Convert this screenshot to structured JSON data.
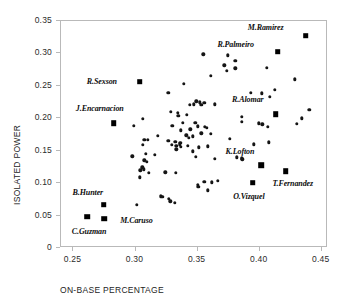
{
  "chart_data": {
    "type": "scatter",
    "title": "",
    "xlabel": "ON-BASE PERCENTAGE",
    "ylabel": "ISOLATED POWER",
    "xlim": [
      0.24,
      0.455
    ],
    "ylim": [
      0.0,
      0.35
    ],
    "xticks": [
      0.25,
      0.3,
      0.35,
      0.4,
      0.45
    ],
    "xticklabels": [
      "0.25",
      "0.30",
      "0.35",
      "0.40",
      "0.45"
    ],
    "yticks": [
      0.0,
      0.05,
      0.1,
      0.15,
      0.2,
      0.25,
      0.3,
      0.35
    ],
    "yticklabels": [
      "0",
      "0.05",
      "0.10",
      "0.15",
      "0.20",
      "0.25",
      "0.30",
      "0.35"
    ],
    "grid": false,
    "legend": null,
    "marker_unlabeled": "circle",
    "marker_labeled": "square",
    "points": [
      {
        "x": 0.3545,
        "y": 0.2985
      },
      {
        "x": 0.3745,
        "y": 0.297
      },
      {
        "x": 0.3805,
        "y": 0.2885
      },
      {
        "x": 0.3715,
        "y": 0.2815
      },
      {
        "x": 0.3805,
        "y": 0.277
      },
      {
        "x": 0.4055,
        "y": 0.278
      },
      {
        "x": 0.3735,
        "y": 0.273
      },
      {
        "x": 0.3605,
        "y": 0.2655
      },
      {
        "x": 0.4285,
        "y": 0.26
      },
      {
        "x": 0.339,
        "y": 0.253
      },
      {
        "x": 0.412,
        "y": 0.244
      },
      {
        "x": 0.393,
        "y": 0.2395
      },
      {
        "x": 0.4015,
        "y": 0.2385
      },
      {
        "x": 0.3265,
        "y": 0.239
      },
      {
        "x": 0.408,
        "y": 0.233
      },
      {
        "x": 0.349,
        "y": 0.226
      },
      {
        "x": 0.352,
        "y": 0.2245
      },
      {
        "x": 0.3555,
        "y": 0.224
      },
      {
        "x": 0.347,
        "y": 0.2215
      },
      {
        "x": 0.353,
        "y": 0.221
      },
      {
        "x": 0.3435,
        "y": 0.2205
      },
      {
        "x": 0.364,
        "y": 0.2215
      },
      {
        "x": 0.44,
        "y": 0.2135
      },
      {
        "x": 0.3285,
        "y": 0.21
      },
      {
        "x": 0.334,
        "y": 0.208
      },
      {
        "x": 0.3415,
        "y": 0.2055
      },
      {
        "x": 0.3345,
        "y": 0.2035
      },
      {
        "x": 0.3855,
        "y": 0.2025
      },
      {
        "x": 0.434,
        "y": 0.2
      },
      {
        "x": 0.306,
        "y": 0.1995
      },
      {
        "x": 0.338,
        "y": 0.1935
      },
      {
        "x": 0.348,
        "y": 0.193
      },
      {
        "x": 0.3855,
        "y": 0.1945
      },
      {
        "x": 0.43,
        "y": 0.1915
      },
      {
        "x": 0.3995,
        "y": 0.192
      },
      {
        "x": 0.402,
        "y": 0.1905
      },
      {
        "x": 0.3295,
        "y": 0.188
      },
      {
        "x": 0.2985,
        "y": 0.1885
      },
      {
        "x": 0.35,
        "y": 0.1875
      },
      {
        "x": 0.356,
        "y": 0.187
      },
      {
        "x": 0.3575,
        "y": 0.185
      },
      {
        "x": 0.4065,
        "y": 0.187
      },
      {
        "x": 0.344,
        "y": 0.183
      },
      {
        "x": 0.3365,
        "y": 0.1815
      },
      {
        "x": 0.353,
        "y": 0.177
      },
      {
        "x": 0.3605,
        "y": 0.1765
      },
      {
        "x": 0.318,
        "y": 0.173
      },
      {
        "x": 0.341,
        "y": 0.174
      },
      {
        "x": 0.346,
        "y": 0.172
      },
      {
        "x": 0.343,
        "y": 0.17
      },
      {
        "x": 0.376,
        "y": 0.1685
      },
      {
        "x": 0.307,
        "y": 0.1665
      },
      {
        "x": 0.31,
        "y": 0.167
      },
      {
        "x": 0.3265,
        "y": 0.165
      },
      {
        "x": 0.332,
        "y": 0.164
      },
      {
        "x": 0.336,
        "y": 0.1625
      },
      {
        "x": 0.3355,
        "y": 0.16
      },
      {
        "x": 0.329,
        "y": 0.159
      },
      {
        "x": 0.333,
        "y": 0.1575
      },
      {
        "x": 0.3365,
        "y": 0.156
      },
      {
        "x": 0.342,
        "y": 0.1575
      },
      {
        "x": 0.306,
        "y": 0.1595
      },
      {
        "x": 0.4075,
        "y": 0.163
      },
      {
        "x": 0.3955,
        "y": 0.16
      },
      {
        "x": 0.351,
        "y": 0.1555
      },
      {
        "x": 0.358,
        "y": 0.157
      },
      {
        "x": 0.333,
        "y": 0.152
      },
      {
        "x": 0.346,
        "y": 0.149
      },
      {
        "x": 0.3085,
        "y": 0.1455
      },
      {
        "x": 0.3155,
        "y": 0.1435
      },
      {
        "x": 0.3815,
        "y": 0.14
      },
      {
        "x": 0.3855,
        "y": 0.138
      },
      {
        "x": 0.386,
        "y": 0.1365
      },
      {
        "x": 0.3485,
        "y": 0.141
      },
      {
        "x": 0.364,
        "y": 0.1375
      },
      {
        "x": 0.2975,
        "y": 0.1415
      },
      {
        "x": 0.307,
        "y": 0.1355
      },
      {
        "x": 0.309,
        "y": 0.1325
      },
      {
        "x": 0.3055,
        "y": 0.1245
      },
      {
        "x": 0.3065,
        "y": 0.1215
      },
      {
        "x": 0.304,
        "y": 0.1195
      },
      {
        "x": 0.3105,
        "y": 0.1155
      },
      {
        "x": 0.3035,
        "y": 0.109
      },
      {
        "x": 0.324,
        "y": 0.1165
      },
      {
        "x": 0.3325,
        "y": 0.1155
      },
      {
        "x": 0.3555,
        "y": 0.102
      },
      {
        "x": 0.3615,
        "y": 0.1015
      },
      {
        "x": 0.3665,
        "y": 0.104
      },
      {
        "x": 0.35,
        "y": 0.0975
      },
      {
        "x": 0.3505,
        "y": 0.0945
      },
      {
        "x": 0.358,
        "y": 0.089
      },
      {
        "x": 0.3205,
        "y": 0.0795
      },
      {
        "x": 0.3215,
        "y": 0.0785
      },
      {
        "x": 0.327,
        "y": 0.0755
      },
      {
        "x": 0.328,
        "y": 0.072
      },
      {
        "x": 0.3315,
        "y": 0.07
      },
      {
        "x": 0.301,
        "y": 0.0665
      }
    ],
    "labeled_points": [
      {
        "name": "M.Ramirez",
        "x": 0.437,
        "y": 0.3275,
        "label_dx": -40,
        "label_dy": -9
      },
      {
        "name": "R.Palmeiro",
        "x": 0.4145,
        "y": 0.3025,
        "label_dx": -42,
        "label_dy": -8
      },
      {
        "name": "R.Sexson",
        "x": 0.3035,
        "y": 0.2565,
        "label_dx": -38,
        "label_dy": -1
      },
      {
        "name": "J.Encarnacion",
        "x": 0.2825,
        "y": 0.1925,
        "label_dx": -14,
        "label_dy": -15
      },
      {
        "name": "R.Alomar",
        "x": 0.413,
        "y": 0.206,
        "label_dx": -28,
        "label_dy": -15
      },
      {
        "name": "K.Lofton",
        "x": 0.401,
        "y": 0.128,
        "label_dx": -21,
        "label_dy": -14
      },
      {
        "name": "T.Fernandez",
        "x": 0.421,
        "y": 0.1185,
        "label_dx": 7,
        "label_dy": 12
      },
      {
        "name": "O.Vizquel",
        "x": 0.3945,
        "y": 0.1005,
        "label_dx": -4,
        "label_dy": 13
      },
      {
        "name": "B.Hunter",
        "x": 0.2745,
        "y": 0.0665,
        "label_dx": -16,
        "label_dy": -13
      },
      {
        "name": "C.Guzman",
        "x": 0.261,
        "y": 0.048,
        "label_dx": 2,
        "label_dy": 14
      },
      {
        "name": "M.Caruso",
        "x": 0.275,
        "y": 0.045,
        "label_dx": 32,
        "label_dy": 1
      }
    ]
  }
}
